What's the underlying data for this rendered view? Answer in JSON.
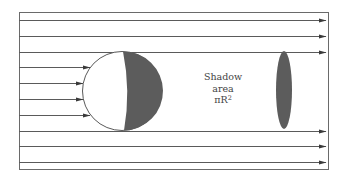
{
  "diagram": {
    "colors": {
      "line": "#5a5a5a",
      "frame": "#6a6a6a",
      "shade": "#5c5c5c",
      "background": "#ffffff"
    },
    "frame": {
      "x": 19,
      "y": 12,
      "width": 309,
      "height": 157
    },
    "rays": [
      {
        "y": 20,
        "x1": 19,
        "x2": 328,
        "arrow": "end"
      },
      {
        "y": 36,
        "x1": 19,
        "x2": 328,
        "arrow": "end"
      },
      {
        "y": 52,
        "x1": 19,
        "x2": 328,
        "arrow": "end"
      },
      {
        "y": 67,
        "x1": 19,
        "x2": 90,
        "arrow": "end"
      },
      {
        "y": 83,
        "x1": 19,
        "x2": 83,
        "arrow": "end"
      },
      {
        "y": 99,
        "x1": 19,
        "x2": 83,
        "arrow": "end"
      },
      {
        "y": 115,
        "x1": 19,
        "x2": 90,
        "arrow": "end"
      },
      {
        "y": 131,
        "x1": 19,
        "x2": 328,
        "arrow": "end"
      },
      {
        "y": 146,
        "x1": 19,
        "x2": 328,
        "arrow": "end"
      },
      {
        "y": 162,
        "x1": 19,
        "x2": 328,
        "arrow": "end"
      }
    ],
    "sphere": {
      "cx": 122,
      "cy": 91,
      "r": 39.5,
      "shaded_side": "right"
    },
    "shadow": {
      "cx": 284,
      "cy": 90,
      "rx": 8,
      "ry": 39
    },
    "label": {
      "lines": [
        "Shadow",
        "area"
      ],
      "formula_base": "πR",
      "formula_exponent": "2",
      "x": 188,
      "y": 71
    }
  }
}
